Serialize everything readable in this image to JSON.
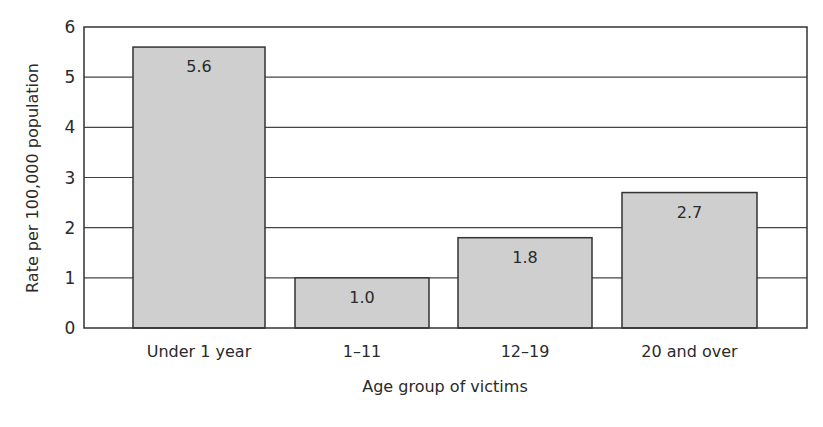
{
  "chart_data": {
    "type": "bar",
    "title": "",
    "xlabel": "Age group of victims",
    "ylabel": "Rate per 100,000 population",
    "categories": [
      "Under 1 year",
      "1–11",
      "12–19",
      "20 and over"
    ],
    "values": [
      5.6,
      1.0,
      1.8,
      2.7
    ],
    "value_labels": [
      "5.6",
      "1.0",
      "1.8",
      "2.7"
    ],
    "ylim": [
      0,
      6
    ],
    "yticks": [
      0,
      1,
      2,
      3,
      4,
      5,
      6
    ],
    "grid": true,
    "legend": null,
    "bar_color": "#cfcfcf",
    "bar_edge_color": "#333333"
  }
}
